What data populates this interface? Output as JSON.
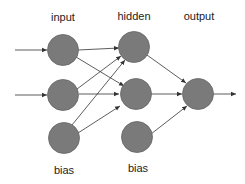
{
  "diagram": {
    "type": "neural-network",
    "layers": [
      {
        "name": "input",
        "label": "input",
        "nodes": 2,
        "bias": true
      },
      {
        "name": "hidden",
        "label": "hidden",
        "nodes": 3,
        "bias": true
      },
      {
        "name": "output",
        "label": "output",
        "nodes": 1,
        "bias": false
      }
    ],
    "bias_labels": {
      "input_bias": "bias",
      "hidden_bias": "bias"
    },
    "colors": {
      "node": "#7a7a7a",
      "edge": "#333333",
      "text": "#222222",
      "background": "#ffffff"
    }
  }
}
